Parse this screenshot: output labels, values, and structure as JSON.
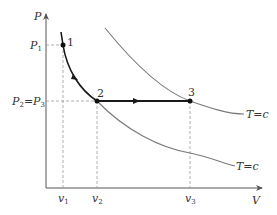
{
  "diagram": {
    "type": "P-V thermodynamic process diagram",
    "axes": {
      "y_label": "P",
      "x_label": "V",
      "y_ticks": [
        {
          "name": "P",
          "sub": "1",
          "text": "P1"
        },
        {
          "name": "P",
          "sub": "2",
          "text": "P2=P3",
          "eq_name": "P",
          "eq_sub": "3"
        }
      ],
      "x_ticks": [
        {
          "name": "v",
          "sub": "1"
        },
        {
          "name": "v",
          "sub": "2"
        },
        {
          "name": "v",
          "sub": "3"
        }
      ]
    },
    "points": [
      {
        "label": "1"
      },
      {
        "label": "2"
      },
      {
        "label": "3"
      }
    ],
    "isotherm_labels": {
      "upper": "T=c",
      "lower": "T=c"
    },
    "processes": [
      {
        "from": "1",
        "to": "2",
        "kind": "curve"
      },
      {
        "from": "2",
        "to": "3",
        "kind": "isobaric"
      }
    ],
    "colors": {
      "axis": "#555555",
      "process": "#1a1a1a",
      "isotherm": "#7a7a7a",
      "guide": "#9a9a9a"
    }
  }
}
